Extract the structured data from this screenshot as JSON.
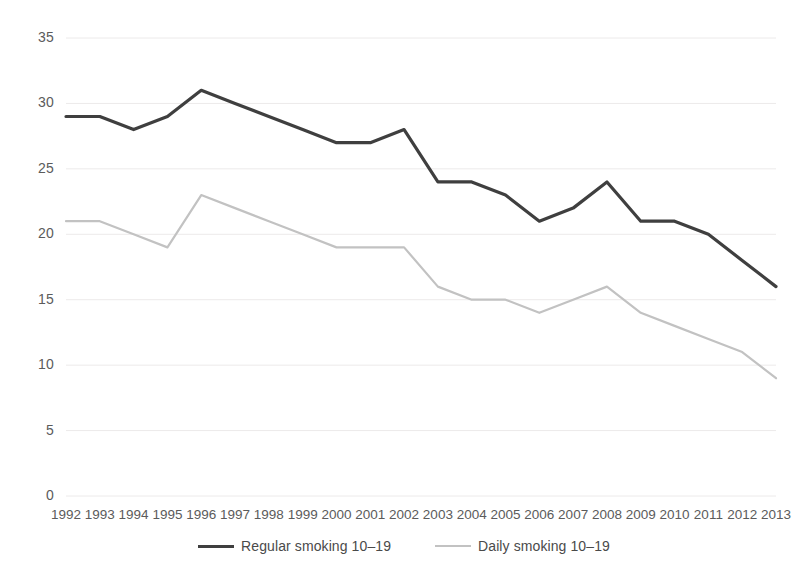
{
  "chart_data": {
    "type": "line",
    "title": "",
    "subtitle": "",
    "xlabel": "",
    "ylabel": "",
    "categories": [
      "1992",
      "1993",
      "1994",
      "1995",
      "1996",
      "1997",
      "1998",
      "1999",
      "2000",
      "2001",
      "2002",
      "2003",
      "2004",
      "2005",
      "2006",
      "2007",
      "2008",
      "2009",
      "2010",
      "2011",
      "2012",
      "2013"
    ],
    "series": [
      {
        "name": "Regular smoking 10–19",
        "color": "#3f3f3f",
        "line_width": 3.2,
        "values": [
          29,
          29,
          28,
          29,
          31,
          30,
          29,
          28,
          27,
          27,
          28,
          24,
          24,
          23,
          21,
          22,
          24,
          21,
          21,
          20,
          18,
          16
        ]
      },
      {
        "name": "Daily smoking 10–19",
        "color": "#c2c2c2",
        "line_width": 2.2,
        "values": [
          21,
          21,
          20,
          19,
          23,
          22,
          21,
          20,
          19,
          19,
          19,
          16,
          15,
          15,
          14,
          15,
          16,
          14,
          13,
          12,
          11,
          9
        ]
      }
    ],
    "ylim": [
      0,
      35
    ],
    "yticks": [
      0,
      5,
      10,
      15,
      20,
      25,
      30,
      35
    ],
    "ytick_labels": [
      "0",
      "5",
      "10",
      "15",
      "20",
      "25",
      "30",
      "35"
    ],
    "grid": true,
    "grid_color": "#eceaea",
    "legend_position": "bottom"
  },
  "legend": {
    "entries": [
      {
        "label": "Regular smoking 10–19"
      },
      {
        "label": "Daily smoking 10–19"
      }
    ]
  }
}
